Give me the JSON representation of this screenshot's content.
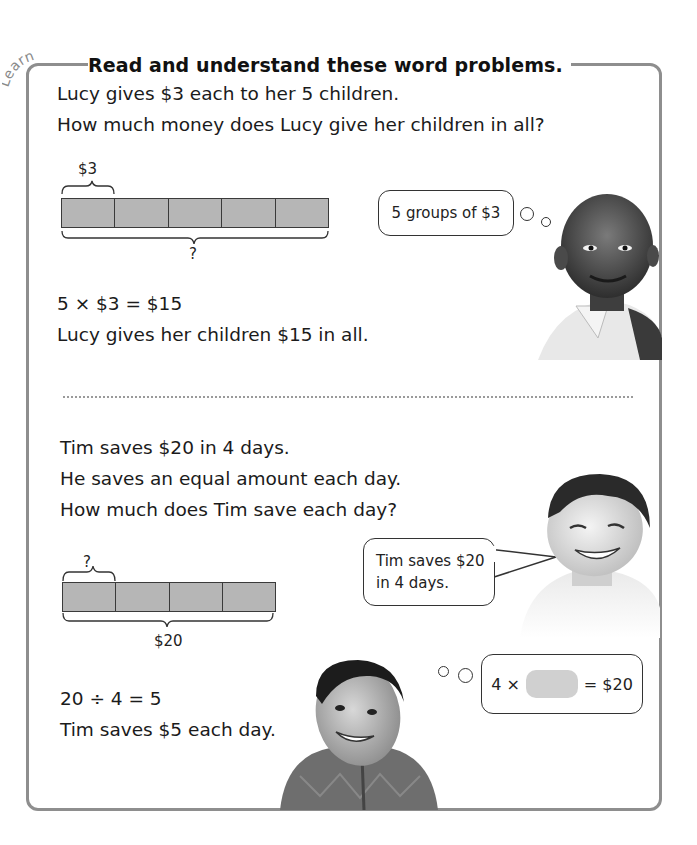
{
  "header": {
    "tag": "Learn",
    "title": "Read and understand these word problems."
  },
  "problem1": {
    "lines": [
      "Lucy gives $3 each to her 5 children.",
      "How much money does Lucy give her children in all?"
    ],
    "bar_model": {
      "segments": 5,
      "part_label": "$3",
      "whole_label": "?"
    },
    "thought_bubble": "5 groups of $3",
    "equation": "5 × $3 = $15",
    "answer": "Lucy gives her children $15 in all."
  },
  "problem2": {
    "lines": [
      "Tim saves $20 in 4 days.",
      "He saves an equal amount each day.",
      "How much does Tim save each day?"
    ],
    "bar_model": {
      "segments": 4,
      "part_label": "?",
      "whole_label": "$20"
    },
    "speech_bubble": [
      "Tim saves $20",
      "in 4 days."
    ],
    "thought_bubble": {
      "left": "4 ×",
      "right": "= $20"
    },
    "equation": "20 ÷ 4 = 5",
    "answer": "Tim saves $5 each day."
  },
  "colors": {
    "frame": "#8e8e8e",
    "bar_fill": "#b6b6b6",
    "blank_fill": "#d0d0d0",
    "divider": "#9a9a9a"
  },
  "images": [
    "boy-smiling-photo",
    "boy-grinning-photo",
    "boy-looking-up-photo"
  ]
}
